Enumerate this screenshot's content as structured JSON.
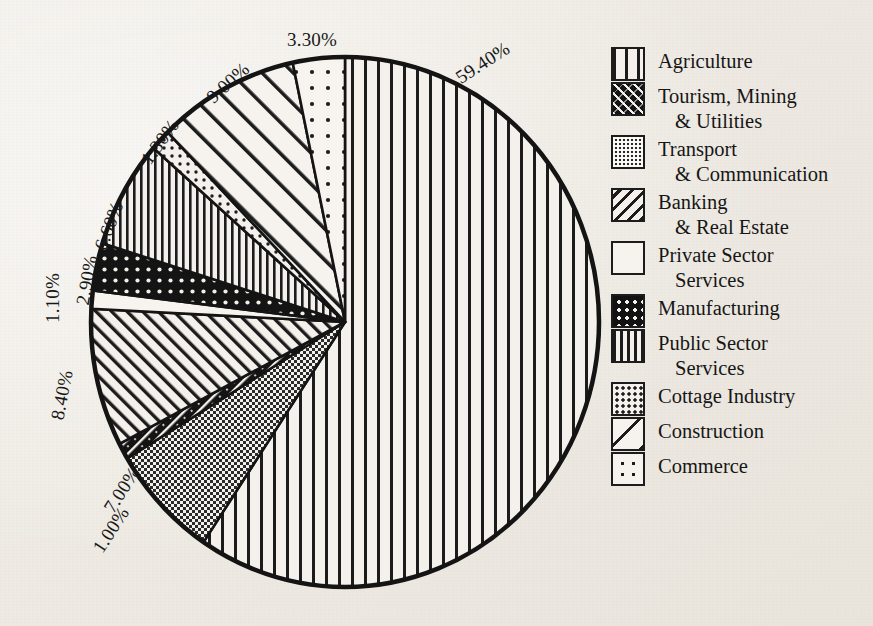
{
  "chart_data": {
    "type": "pie",
    "title": "",
    "subtitle": "",
    "xlabel": "",
    "ylabel": "",
    "legend_position": "right",
    "grid": false,
    "start_angle_deg": 0,
    "direction": "clockwise",
    "categories": [
      "Agriculture",
      "Transport & Communication",
      "Tourism, Mining & Utilities",
      "Banking & Real Estate",
      "Private Sector Services",
      "Manufacturing",
      "Public Sector Services",
      "Cottage Industry",
      "Construction",
      "Commerce"
    ],
    "values": [
      59.4,
      7.0,
      1.0,
      8.4,
      1.1,
      2.9,
      6.6,
      1.3,
      9.0,
      3.3
    ],
    "value_labels": [
      "59.40%",
      "7.00%",
      "1.00%",
      "8.40%",
      "1.10%",
      "2.90%",
      "6.60%",
      "1.30%",
      "9.00%",
      "3.30%"
    ],
    "units": "percent",
    "total": 99.0
  },
  "pie": {
    "slices": [
      {
        "name": "Agriculture",
        "value": 59.4,
        "label": "59.40%",
        "pattern": "vertical-lines-wide",
        "label_x": 453,
        "label_y": 52,
        "label_rot": -33
      },
      {
        "name": "Transport & Communication",
        "value": 7.0,
        "label": "7.00%",
        "pattern": "checkerboard",
        "label_x": 97,
        "label_y": 479,
        "label_rot": -57
      },
      {
        "name": "Tourism, Mining & Utilities",
        "value": 1.0,
        "label": "1.00%",
        "pattern": "dark-diagonal",
        "label_x": 86,
        "label_y": 519,
        "label_rot": -57
      },
      {
        "name": "Banking & Real Estate",
        "value": 8.4,
        "label": "8.40%",
        "pattern": "diagonal-hatch",
        "label_x": 37,
        "label_y": 384,
        "label_rot": -79
      },
      {
        "name": "Private Sector Services",
        "value": 1.1,
        "label": "1.10%",
        "pattern": "empty",
        "label_x": 28,
        "label_y": 287,
        "label_rot": -90
      },
      {
        "name": "Manufacturing",
        "value": 2.9,
        "label": "2.90%",
        "pattern": "dark-dots",
        "label_x": 62,
        "label_y": 269,
        "label_rot": -80
      },
      {
        "name": "Public Sector Services",
        "value": 6.6,
        "label": "6.60%",
        "pattern": "vertical-lines-narrow",
        "label_x": 84,
        "label_y": 215,
        "label_rot": -69
      },
      {
        "name": "Cottage Industry",
        "value": 1.3,
        "label": "1.30%",
        "pattern": "fine-dots",
        "label_x": 135,
        "label_y": 131,
        "label_rot": -54
      },
      {
        "name": "Construction",
        "value": 9.0,
        "label": "9.00%",
        "pattern": "single-diagonal",
        "label_x": 203,
        "label_y": 72,
        "label_rot": -42
      },
      {
        "name": "Commerce",
        "value": 3.3,
        "label": "3.30%",
        "pattern": "sparse-dots",
        "label_x": 287,
        "label_y": 29,
        "label_rot": 0
      }
    ]
  },
  "legend": {
    "items": [
      {
        "label_line1": "Agriculture",
        "label_line2": "",
        "swatch": "vertical-lines-wide"
      },
      {
        "label_line1": "Tourism, Mining",
        "label_line2": "& Utilities",
        "swatch": "dark-diagonal"
      },
      {
        "label_line1": "Transport",
        "label_line2": "& Communication",
        "swatch": "checkerboard"
      },
      {
        "label_line1": "Banking",
        "label_line2": "& Real Estate",
        "swatch": "diagonal-hatch"
      },
      {
        "label_line1": "Private Sector",
        "label_line2": "Services",
        "swatch": "empty"
      },
      {
        "label_line1": "Manufacturing",
        "label_line2": "",
        "swatch": "dark-dots"
      },
      {
        "label_line1": "Public Sector",
        "label_line2": "Services",
        "swatch": "vertical-lines-narrow"
      },
      {
        "label_line1": "Cottage Industry",
        "label_line2": "",
        "swatch": "fine-dots"
      },
      {
        "label_line1": "Construction",
        "label_line2": "",
        "swatch": "single-diagonal"
      },
      {
        "label_line1": "Commerce",
        "label_line2": "",
        "swatch": "sparse-dots"
      }
    ]
  },
  "colors": {
    "ink": "#1a1a1a",
    "paper": "#f0ede8",
    "fill": "#f4f1ec",
    "dark_fill": "#141414"
  }
}
